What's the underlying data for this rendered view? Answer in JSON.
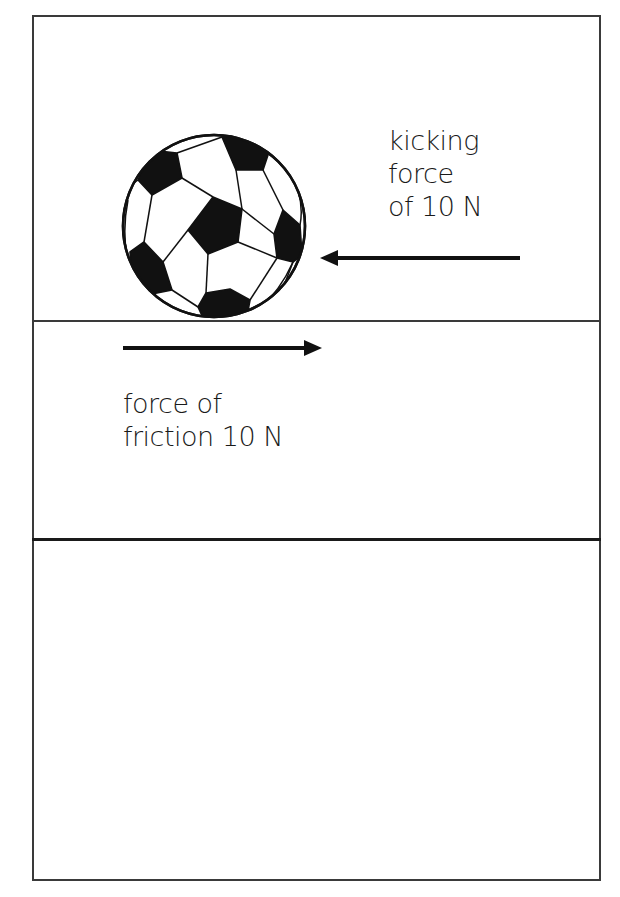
{
  "diagram": {
    "title": "",
    "object": "soccer-ball",
    "forces": [
      {
        "name": "kicking force",
        "label_lines": [
          "kicking",
          "force",
          "of 10 N"
        ],
        "magnitude": "10 N",
        "direction": "left"
      },
      {
        "name": "friction force",
        "label_lines": [
          "force of",
          "friction 10 N"
        ],
        "magnitude": "10 N",
        "direction": "right"
      }
    ],
    "panels": 3,
    "colors": {
      "ink": "#1a1a1a",
      "frame": "#3a3a3a",
      "background": "#ffffff"
    }
  }
}
